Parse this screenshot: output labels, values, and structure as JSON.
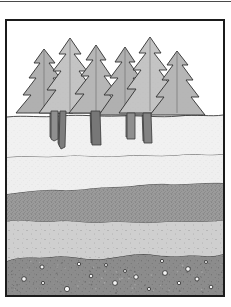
{
  "figure": {
    "title": "Soil profile cross-section with conifer forest",
    "caption": "",
    "frame": {
      "border_color": "#1b1b1b",
      "border_width_px": 2,
      "background": "#ffffff",
      "x": 5,
      "y": 19,
      "width": 220,
      "height": 278
    },
    "top_rule": {
      "color": "#4a4a4a",
      "y": 1,
      "height": 1
    }
  },
  "scene": {
    "width": 216,
    "height": 274,
    "sky": {
      "label": "sky",
      "color": "#ffffff",
      "top": 0,
      "bottom": 94
    },
    "outline_color": "#2a2a2a",
    "horizon_y": 94
  },
  "trees": {
    "label": "conifer forest",
    "count": 6,
    "canopy_fill": "#b0b0b0",
    "canopy_fill_light": "#c4c4c4",
    "canopy_outline": "#2f2f2f",
    "trunk_fill": "#8f8f8f",
    "trunk_outline": "#3a3a3a",
    "items": [
      {
        "name": "tree-left-outer",
        "cx": 37,
        "base_y": 96,
        "top_y": 28,
        "half_width": 29,
        "tiers": 6,
        "fill": "#b0b0b0"
      },
      {
        "name": "tree-left-mid",
        "cx": 63,
        "base_y": 96,
        "top_y": 17,
        "half_width": 31,
        "tiers": 7,
        "fill": "#c2c2c2"
      },
      {
        "name": "tree-left-inner",
        "cx": 89,
        "base_y": 96,
        "top_y": 24,
        "half_width": 28,
        "tiers": 6,
        "fill": "#b6b6b6"
      },
      {
        "name": "tree-right-inner",
        "cx": 118,
        "base_y": 96,
        "top_y": 26,
        "half_width": 27,
        "tiers": 6,
        "fill": "#b0b0b0"
      },
      {
        "name": "tree-right-mid",
        "cx": 143,
        "base_y": 96,
        "top_y": 16,
        "half_width": 31,
        "tiers": 7,
        "fill": "#c2c2c2"
      },
      {
        "name": "tree-right-outer",
        "cx": 170,
        "base_y": 96,
        "top_y": 30,
        "half_width": 28,
        "tiers": 6,
        "fill": "#b6b6b6"
      }
    ],
    "trunks": [
      {
        "name": "trunk-1",
        "x": 44,
        "top": 92,
        "bottom": 118,
        "width": 7,
        "fill": "#8f8f8f"
      },
      {
        "name": "trunk-2",
        "x": 53,
        "top": 92,
        "bottom": 128,
        "width": 6,
        "fill": "#7f7f7f"
      },
      {
        "name": "trunk-3",
        "x": 84,
        "top": 92,
        "bottom": 126,
        "width": 9,
        "fill": "#7a7a7a"
      },
      {
        "name": "trunk-4",
        "x": 120,
        "top": 94,
        "bottom": 120,
        "width": 8,
        "fill": "#8f8f8f"
      },
      {
        "name": "trunk-5",
        "x": 136,
        "top": 94,
        "bottom": 124,
        "width": 8,
        "fill": "#848484"
      }
    ]
  },
  "soil_layers": [
    {
      "id": "layer-o-topsoil",
      "name": "topsoil-layer",
      "order": 1,
      "top": 94,
      "bottom": 134,
      "fill": "#f1f1f1",
      "texture": "fine-stipple",
      "speckle_density": "very-low",
      "speckle_color": "#bdbdbd",
      "boundary_color": "#3a3a3a",
      "boundary_style": "wavy"
    },
    {
      "id": "layer-a-subsoil",
      "name": "upper-subsoil-layer",
      "order": 2,
      "top": 134,
      "bottom": 166,
      "fill": "#efefef",
      "texture": "fine-stipple",
      "speckle_density": "low",
      "speckle_color": "#b5b5b5",
      "boundary_color": "#3a3a3a",
      "boundary_style": "wavy"
    },
    {
      "id": "layer-b-dark",
      "name": "dark-mineral-layer",
      "order": 3,
      "top": 166,
      "bottom": 199,
      "fill": "#9b9b9b",
      "texture": "dense-stipple",
      "speckle_density": "high",
      "speckle_color": "#5e5e5e",
      "boundary_color": "#3a3a3a",
      "boundary_style": "wavy"
    },
    {
      "id": "layer-c-light",
      "name": "pale-sediment-layer",
      "order": 4,
      "top": 199,
      "bottom": 236,
      "fill": "#cfcfcf",
      "texture": "sparse-stipple",
      "speckle_density": "medium-low",
      "speckle_color": "#6a6a6a",
      "boundary_color": "#3a3a3a",
      "boundary_style": "wavy"
    },
    {
      "id": "layer-r-parent",
      "name": "parent-material-layer",
      "order": 5,
      "top": 236,
      "bottom": 274,
      "fill": "#8c8c8c",
      "texture": "gravel",
      "speckle_density": "medium",
      "speckle_color": "#5a5a5a",
      "boundary_color": "#2f2f2f",
      "boundary_style": "wavy"
    }
  ],
  "pebbles": {
    "name": "rock-fragments",
    "fill": "#f5f5f5",
    "outline": "#2b2b2b",
    "items": [
      {
        "cx": 17,
        "cy": 258,
        "r": 2.3
      },
      {
        "cx": 35,
        "cy": 246,
        "r": 2.0
      },
      {
        "cx": 36,
        "cy": 262,
        "r": 1.6
      },
      {
        "cx": 60,
        "cy": 268,
        "r": 2.6
      },
      {
        "cx": 72,
        "cy": 243,
        "r": 1.7
      },
      {
        "cx": 84,
        "cy": 255,
        "r": 1.8
      },
      {
        "cx": 99,
        "cy": 244,
        "r": 1.5
      },
      {
        "cx": 108,
        "cy": 262,
        "r": 2.4
      },
      {
        "cx": 118,
        "cy": 250,
        "r": 1.5
      },
      {
        "cx": 129,
        "cy": 256,
        "r": 2.2
      },
      {
        "cx": 142,
        "cy": 268,
        "r": 1.6
      },
      {
        "cx": 155,
        "cy": 240,
        "r": 1.6
      },
      {
        "cx": 158,
        "cy": 252,
        "r": 2.4
      },
      {
        "cx": 172,
        "cy": 262,
        "r": 1.7
      },
      {
        "cx": 181,
        "cy": 248,
        "r": 2.3
      },
      {
        "cx": 190,
        "cy": 258,
        "r": 2.0
      },
      {
        "cx": 199,
        "cy": 241,
        "r": 1.5
      },
      {
        "cx": 204,
        "cy": 266,
        "r": 1.8
      }
    ]
  }
}
